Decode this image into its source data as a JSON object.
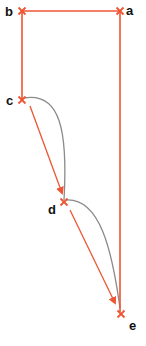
{
  "diagram": {
    "colors": {
      "path": "#ee5533",
      "curve": "#8a8a8a",
      "marker": "#ee5533",
      "label": "#111111",
      "background": "#ffffff"
    },
    "nodes": [
      {
        "id": "a",
        "label": "a",
        "x": 120,
        "y": 11
      },
      {
        "id": "b",
        "label": "b",
        "x": 22,
        "y": 11
      },
      {
        "id": "c",
        "label": "c",
        "x": 22,
        "y": 100
      },
      {
        "id": "d",
        "label": "d",
        "x": 64,
        "y": 202
      },
      {
        "id": "e",
        "label": "e",
        "x": 121,
        "y": 314
      }
    ],
    "edges": [
      {
        "from": "a",
        "to": "b",
        "type": "straight",
        "arrow": false
      },
      {
        "from": "b",
        "to": "c",
        "type": "straight",
        "arrow": false
      },
      {
        "from": "a",
        "to": "e",
        "type": "straight",
        "arrow": false
      },
      {
        "from": "c",
        "to": "d",
        "type": "straight",
        "arrow": true
      },
      {
        "from": "d",
        "to": "e",
        "type": "straight",
        "arrow": true
      },
      {
        "from": "c",
        "to": "d",
        "type": "curve",
        "arrow": false
      },
      {
        "from": "d",
        "to": "e",
        "type": "curve",
        "arrow": false
      }
    ]
  }
}
